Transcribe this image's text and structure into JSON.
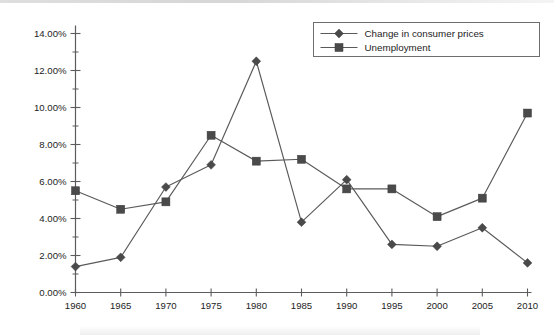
{
  "chart_data": {
    "type": "line",
    "title": "",
    "subtitle": "",
    "xlabel": "",
    "ylabel": "",
    "grid": false,
    "legend_position": "top-right",
    "x": [
      1960,
      1965,
      1970,
      1975,
      1980,
      1985,
      1990,
      1995,
      2000,
      2005,
      2010
    ],
    "categories": [
      "1960",
      "1965",
      "1970",
      "1975",
      "1980",
      "1985",
      "1990",
      "1995",
      "2000",
      "2005",
      "2010"
    ],
    "xtick_labels": [
      "1960",
      "1965",
      "1970",
      "1975",
      "1980",
      "1985",
      "1990",
      "1995",
      "2000",
      "2005",
      "2010"
    ],
    "ytick_labels": [
      "0.00%",
      "2.00%",
      "4.00%",
      "6.00%",
      "8.00%",
      "10.00%",
      "12.00%",
      "14.00%"
    ],
    "ytick_values": [
      0,
      2,
      4,
      6,
      8,
      10,
      12,
      14
    ],
    "yminor_values": [
      1,
      3,
      5,
      7,
      9,
      11,
      13
    ],
    "ylim": [
      0,
      14
    ],
    "xlim": [
      1960,
      2010
    ],
    "y_unit": "%",
    "series": [
      {
        "name": "Change in consumer prices",
        "marker": "diamond",
        "color": "#4a4a4a",
        "values": [
          1.4,
          1.9,
          5.7,
          6.9,
          12.5,
          3.8,
          6.1,
          2.6,
          2.5,
          3.5,
          1.6
        ]
      },
      {
        "name": "Unemployment",
        "marker": "square",
        "color": "#4a4a4a",
        "values": [
          5.5,
          4.5,
          4.9,
          8.5,
          7.1,
          7.2,
          5.6,
          5.6,
          4.1,
          5.1,
          9.7
        ]
      }
    ]
  },
  "legend": {
    "entries": [
      {
        "label": "Change in consumer prices",
        "marker": "diamond"
      },
      {
        "label": "Unemployment",
        "marker": "square"
      }
    ]
  }
}
